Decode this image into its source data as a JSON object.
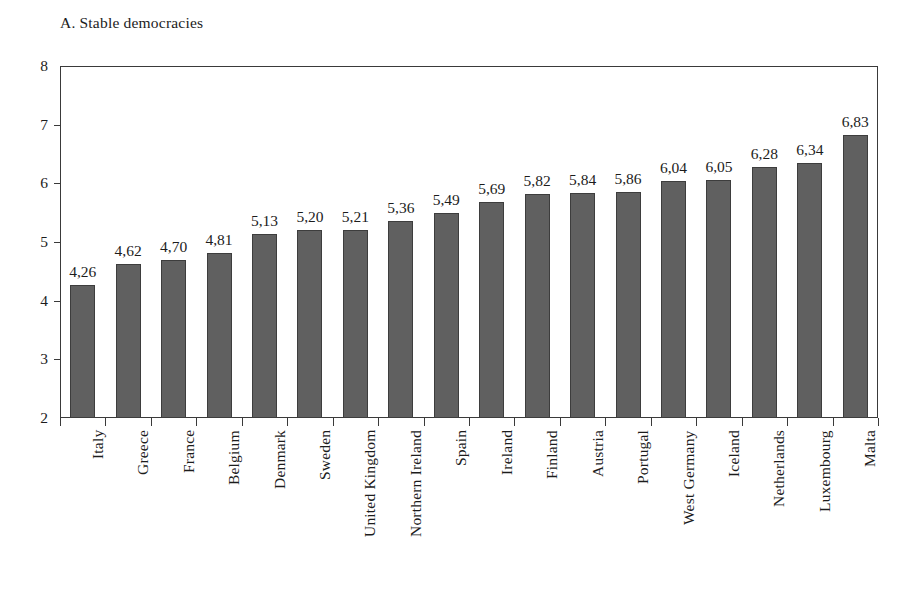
{
  "chart_title": "A. Stable democracies",
  "axis": {
    "y_ticks": [
      "8",
      "7",
      "6",
      "5",
      "4",
      "3",
      "2"
    ]
  },
  "style": {
    "bar_fill": "#606060",
    "bar_stroke": "#3d3d3d",
    "axis_color": "#3a3a3a",
    "text_color": "#1c1c1c",
    "background": "#ffffff"
  },
  "chart_data": {
    "type": "bar",
    "title": "A. Stable democracies",
    "xlabel": "",
    "ylabel": "",
    "ylim": [
      2,
      8
    ],
    "ytick_values": [
      2,
      3,
      4,
      5,
      6,
      7,
      8
    ],
    "grid": false,
    "legend": null,
    "decimal_separator": ",",
    "orientation": "vertical",
    "label_rotation": 90,
    "categories": [
      "Italy",
      "Greece",
      "France",
      "Belgium",
      "Denmark",
      "Sweden",
      "United Kingdom",
      "Northern Ireland",
      "Spain",
      "Ireland",
      "Finland",
      "Austria",
      "Portugal",
      "West Germany",
      "Iceland",
      "Netherlands",
      "Luxembourg",
      "Malta"
    ],
    "values": [
      4.26,
      4.62,
      4.7,
      4.81,
      5.13,
      5.2,
      5.21,
      5.36,
      5.49,
      5.69,
      5.82,
      5.84,
      5.86,
      6.04,
      6.05,
      6.28,
      6.34,
      6.83
    ],
    "value_labels": [
      "4,26",
      "4,62",
      "4,70",
      "4,81",
      "5,13",
      "5,20",
      "5,21",
      "5,36",
      "5,49",
      "5,69",
      "5,82",
      "5,84",
      "5,86",
      "6,04",
      "6,05",
      "6,28",
      "6,34",
      "6,83"
    ]
  }
}
